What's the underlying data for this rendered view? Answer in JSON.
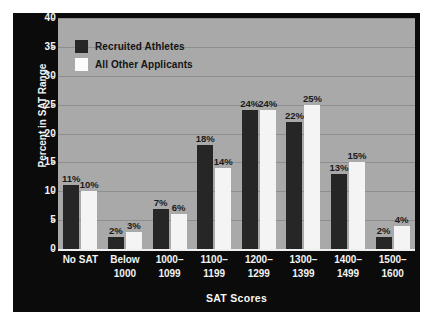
{
  "chart_data": {
    "type": "bar",
    "title": "",
    "xlabel": "SAT Scores",
    "ylabel": "Percent in SAT Range",
    "ylim": [
      0,
      40
    ],
    "ytick_step": 5,
    "yticks": [
      "40",
      "35",
      "30",
      "25",
      "20",
      "15",
      "10",
      "5",
      "0"
    ],
    "grid": true,
    "legend_position": "top-left",
    "categories": [
      "No SAT",
      "Below 1000",
      "1000–1099",
      "1100–1199",
      "1200–1299",
      "1300–1399",
      "1400–1499",
      "1500–1600"
    ],
    "category_lines": [
      [
        "No SAT",
        ""
      ],
      [
        "Below",
        "1000"
      ],
      [
        "1000–",
        "1099"
      ],
      [
        "1100–",
        "1199"
      ],
      [
        "1200–",
        "1299"
      ],
      [
        "1300–",
        "1399"
      ],
      [
        "1400–",
        "1499"
      ],
      [
        "1500–",
        "1600"
      ]
    ],
    "series": [
      {
        "name": "Recruited Athletes",
        "color": "#262626",
        "values": [
          11,
          2,
          7,
          18,
          24,
          22,
          13,
          2
        ],
        "labels": [
          "11%",
          "2%",
          "7%",
          "18%",
          "24%",
          "22%",
          "13%",
          "2%"
        ]
      },
      {
        "name": "All Other Applicants",
        "color": "#f4f4f4",
        "values": [
          10,
          3,
          6,
          14,
          24,
          25,
          15,
          4
        ],
        "labels": [
          "10%",
          "3%",
          "6%",
          "14%",
          "24%",
          "25%",
          "15%",
          "4%"
        ]
      }
    ]
  },
  "colors": {
    "frame": "#0b0b0b",
    "plot_background": "#a9a9a9",
    "gridline": "#8e8e8e",
    "axis_text": "#f2f2f2",
    "label_text": "#1b1b1b",
    "series_dark": "#262626",
    "series_light": "#f4f4f4"
  }
}
